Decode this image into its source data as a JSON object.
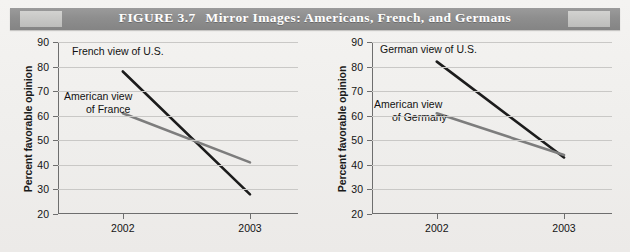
{
  "figure": {
    "number": "FIGURE 3.7",
    "title": "Mirror Images: Americans, French, and Germans"
  },
  "chart_data": [
    {
      "type": "line",
      "panel": "left",
      "title": "",
      "xlabel": "",
      "ylabel": "Percent favorable opinion",
      "categories": [
        "2002",
        "2003"
      ],
      "x": [
        "2002",
        "2003"
      ],
      "ylim": [
        20,
        90
      ],
      "yticks": [
        20,
        30,
        40,
        50,
        60,
        70,
        80,
        90
      ],
      "grid": true,
      "legend": "inline-annotations",
      "series": [
        {
          "name": "French view of U.S.",
          "values": [
            78,
            28
          ],
          "color": "#1c1c1c",
          "label_line1": "French view of U.S.",
          "label_line2": ""
        },
        {
          "name": "American view of France",
          "values": [
            61,
            41
          ],
          "color": "#7d7d7d",
          "label_line1": "American view",
          "label_line2": "of France"
        }
      ]
    },
    {
      "type": "line",
      "panel": "right",
      "title": "",
      "xlabel": "",
      "ylabel": "Percent favorable opinion",
      "categories": [
        "2002",
        "2003"
      ],
      "x": [
        "2002",
        "2003"
      ],
      "ylim": [
        20,
        90
      ],
      "yticks": [
        20,
        30,
        40,
        50,
        60,
        70,
        80,
        90
      ],
      "grid": true,
      "legend": "inline-annotations",
      "series": [
        {
          "name": "German view of U.S.",
          "values": [
            82,
            43
          ],
          "color": "#1c1c1c",
          "label_line1": "German view of U.S.",
          "label_line2": ""
        },
        {
          "name": "American view of Germany",
          "values": [
            61,
            44
          ],
          "color": "#7d7d7d",
          "label_line1": "American view",
          "label_line2": "of Germany"
        }
      ]
    }
  ]
}
